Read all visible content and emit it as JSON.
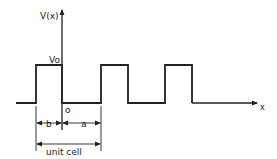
{
  "diagram": {
    "line_color": "#222222",
    "background": "#ffffff",
    "labels": {
      "y_axis": "V(x)",
      "x_axis": "x",
      "barrier_height": "Vo",
      "origin": "o",
      "barrier_width": "b",
      "well_width": "a",
      "period": "unit cell"
    },
    "axes": {
      "y_axis": {
        "x": 62,
        "y_top": 10,
        "y_bottom": 130
      },
      "x_axis": {
        "x_start": 16,
        "x_end": 257,
        "y": 103
      }
    },
    "potential_profile": {
      "baseline_y": 103,
      "top_y": 65,
      "barriers": [
        {
          "x_left": 36,
          "x_right": 62
        },
        {
          "x_left": 101,
          "x_right": 128
        },
        {
          "x_left": 165,
          "x_right": 192
        }
      ]
    },
    "dimensions": {
      "b": {
        "x1": 36,
        "x2": 62,
        "y": 123
      },
      "a": {
        "x1": 62,
        "x2": 101,
        "y": 123
      },
      "unit_cell": {
        "x1": 36,
        "x2": 101,
        "y": 144
      },
      "extension_lines": [
        {
          "x": 36,
          "y1": 106,
          "y2": 151
        },
        {
          "x": 101,
          "y1": 106,
          "y2": 151
        }
      ]
    }
  }
}
